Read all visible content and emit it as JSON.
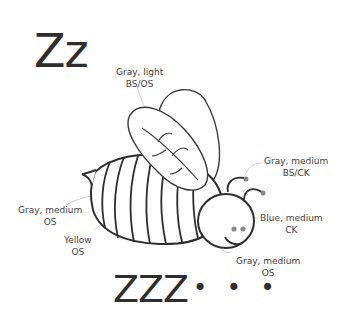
{
  "title": "Zz",
  "snore_text": "ZZZ",
  "ellipsis": "...",
  "labels": {
    "wings": {
      "line1": "Gray, light",
      "line2": "BS/OS"
    },
    "antennae": {
      "line1": "Gray, medium",
      "line2": "BS/CK"
    },
    "eyes": {
      "line1": "Blue, medium",
      "line2": "CK"
    },
    "head": {
      "line1": "Gray, medium",
      "line2": "OS"
    },
    "stinger": {
      "line1": "Gray, medium",
      "line2": "OS"
    },
    "stripes": {
      "line1": "Yellow",
      "line2": "OS"
    }
  },
  "colors": {
    "outline": "#2e2e2e",
    "leader": "#c8c8c8",
    "antenna_tip": "#888888",
    "eye": "#8a8a8a"
  }
}
